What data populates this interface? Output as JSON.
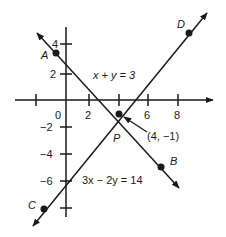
{
  "diagram": {
    "type": "coordinate-plane-two-lines",
    "axes": {
      "x_tick_labels": [
        "0",
        "2",
        "6",
        "8"
      ],
      "y_tick_labels": [
        "4",
        "2",
        "−2",
        "−4",
        "−6"
      ]
    },
    "lines": [
      {
        "equation": "x + y = 3",
        "points": [
          "A",
          "B"
        ]
      },
      {
        "equation": "3x − 2y = 14",
        "points": [
          "C",
          "D"
        ]
      }
    ],
    "points": {
      "A": "A",
      "B": "B",
      "C": "C",
      "D": "D",
      "P": "P"
    },
    "intersection_label": "(4, −1)",
    "colors": {
      "ink": "#1a1a1a",
      "background": "#ffffff"
    }
  }
}
